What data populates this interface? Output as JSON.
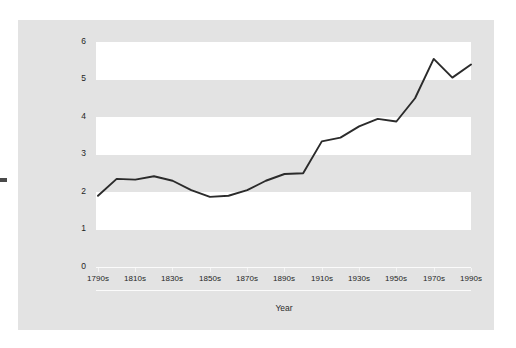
{
  "chart_data": {
    "type": "line",
    "title": "",
    "xlabel": "Year",
    "ylabel": "Average Number of Terms of Service by Decade",
    "xlim": [
      0,
      20
    ],
    "ylim": [
      0,
      6
    ],
    "grid": false,
    "legend": null,
    "banded_background": true,
    "series": [
      {
        "name": "Average Number of Terms of Service by Decade",
        "color": "#2b2b2b",
        "x": [
          "1790s",
          "1800s",
          "1810s",
          "1820s",
          "1830s",
          "1840s",
          "1850s",
          "1860s",
          "1870s",
          "1880s",
          "1890s",
          "1900s",
          "1910s",
          "1920s",
          "1930s",
          "1940s",
          "1950s",
          "1960s",
          "1970s",
          "1980s",
          "1990s"
        ],
        "values": [
          1.9,
          2.35,
          2.33,
          2.42,
          2.3,
          2.05,
          1.87,
          1.9,
          2.05,
          2.3,
          2.48,
          2.5,
          3.35,
          3.45,
          3.75,
          3.95,
          3.88,
          4.5,
          5.55,
          5.05,
          5.4
        ]
      }
    ],
    "x_tick_labels": [
      "1790s",
      "1810s",
      "1830s",
      "1850s",
      "1870s",
      "1890s",
      "1910s",
      "1930s",
      "1950s",
      "1970s",
      "1990s"
    ],
    "y_tick_labels": [
      "0",
      "1",
      "2",
      "3",
      "4",
      "5",
      "6"
    ],
    "y_ticks": [
      0,
      1,
      2,
      3,
      4,
      5,
      6
    ],
    "colors": {
      "panel_background": "#e3e3e3",
      "band_fill": "#ffffff",
      "line": "#2b2b2b",
      "text": "#1f1f1f",
      "page_background": "#ffffff"
    }
  }
}
